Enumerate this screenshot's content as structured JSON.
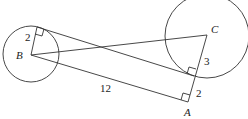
{
  "diagram": {
    "type": "geometry",
    "points": {
      "B": {
        "label": "B",
        "x": 31,
        "y": 55
      },
      "C": {
        "label": "C",
        "x": 207,
        "y": 35
      },
      "A": {
        "label": "A",
        "x": 188,
        "y": 102
      },
      "P": {
        "x": 37,
        "y": 27
      },
      "Q": {
        "x": 194,
        "y": 76
      }
    },
    "circles": [
      {
        "center": "B",
        "cx": 31,
        "cy": 54,
        "r": 28
      },
      {
        "center": "C",
        "cx": 207,
        "cy": 36,
        "r": 42
      }
    ],
    "labels": {
      "B": "B",
      "C": "C",
      "A": "A",
      "radius_B": "2",
      "segment_CQ": "3",
      "segment_QA": "2",
      "segment_BA": "12"
    }
  }
}
